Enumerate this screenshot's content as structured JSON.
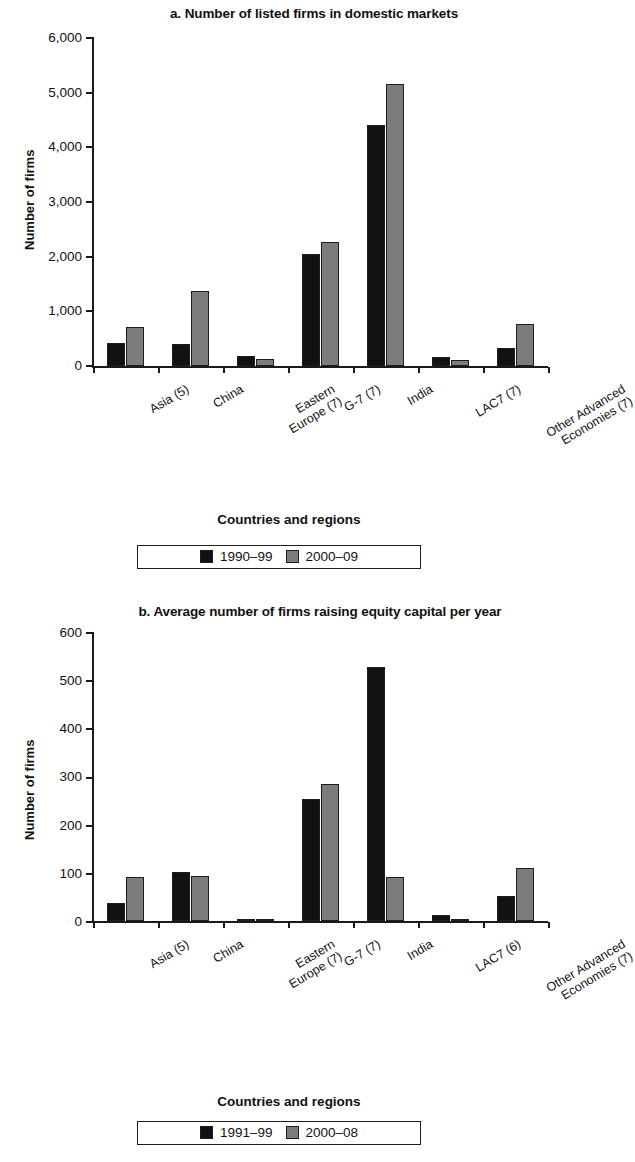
{
  "chart_data": [
    {
      "type": "bar",
      "panel": "a",
      "title": "a. Number of listed firms in domestic markets",
      "xlabel": "Countries and regions",
      "ylabel": "Number of firms",
      "ylim": [
        0,
        6000
      ],
      "yticks": [
        "0",
        "1,000",
        "2,000",
        "3,000",
        "4,000",
        "5,000",
        "6,000"
      ],
      "ytick_values": [
        0,
        1000,
        2000,
        3000,
        4000,
        5000,
        6000
      ],
      "grid": false,
      "legend_position": "bottom",
      "categories": [
        "Asia (5)",
        "Eastern\nEurope (7)",
        "China",
        "G-7 (7)",
        "India",
        "LAC7 (7)",
        "Other Advanced\nEconomies (7)"
      ],
      "category_lines": [
        [
          "Asia (5)"
        ],
        [
          "China"
        ],
        [
          "Eastern",
          "Europe (7)"
        ],
        [
          "G-7 (7)"
        ],
        [
          "India"
        ],
        [
          "LAC7 (7)"
        ],
        [
          "Other Advanced",
          "Economies (7)"
        ]
      ],
      "series": [
        {
          "name": "1990–99",
          "color": "#121212",
          "values": [
            420,
            410,
            180,
            2040,
            4400,
            165,
            320
          ]
        },
        {
          "name": "2000–09",
          "color": "#7c7c7c",
          "values": [
            710,
            1370,
            125,
            2270,
            5150,
            110,
            770
          ]
        }
      ]
    },
    {
      "type": "bar",
      "panel": "b",
      "title": "b. Average number of firms raising equity capital per year",
      "xlabel": "Countries and regions",
      "ylabel": "Number of firms",
      "ylim": [
        0,
        600
      ],
      "yticks": [
        "0",
        "100",
        "200",
        "300",
        "400",
        "500",
        "600"
      ],
      "ytick_values": [
        0,
        100,
        200,
        300,
        400,
        500,
        600
      ],
      "grid": false,
      "legend_position": "bottom",
      "categories": [
        "Asia (5)",
        "China",
        "Eastern\nEurope (7)",
        "G-7 (7)",
        "India",
        "LAC7 (6)",
        "Other Advanced\nEconomies (7)"
      ],
      "category_lines": [
        [
          "Asia (5)"
        ],
        [
          "China"
        ],
        [
          "Eastern",
          "Europe (7)"
        ],
        [
          "G-7 (7)"
        ],
        [
          "India"
        ],
        [
          "LAC7 (6)"
        ],
        [
          "Other Advanced",
          "Economies (7)"
        ]
      ],
      "series": [
        {
          "name": "1991–99",
          "color": "#121212",
          "values": [
            38,
            101,
            2,
            253,
            527,
            12,
            52
          ]
        },
        {
          "name": "2000–08",
          "color": "#7c7c7c",
          "values": [
            91,
            93,
            4,
            285,
            92,
            3,
            110
          ]
        }
      ]
    }
  ],
  "colors": {
    "series_1": "#121212",
    "series_2": "#7c7c7c",
    "axis": "#1a1a1a",
    "background": "#ffffff"
  }
}
